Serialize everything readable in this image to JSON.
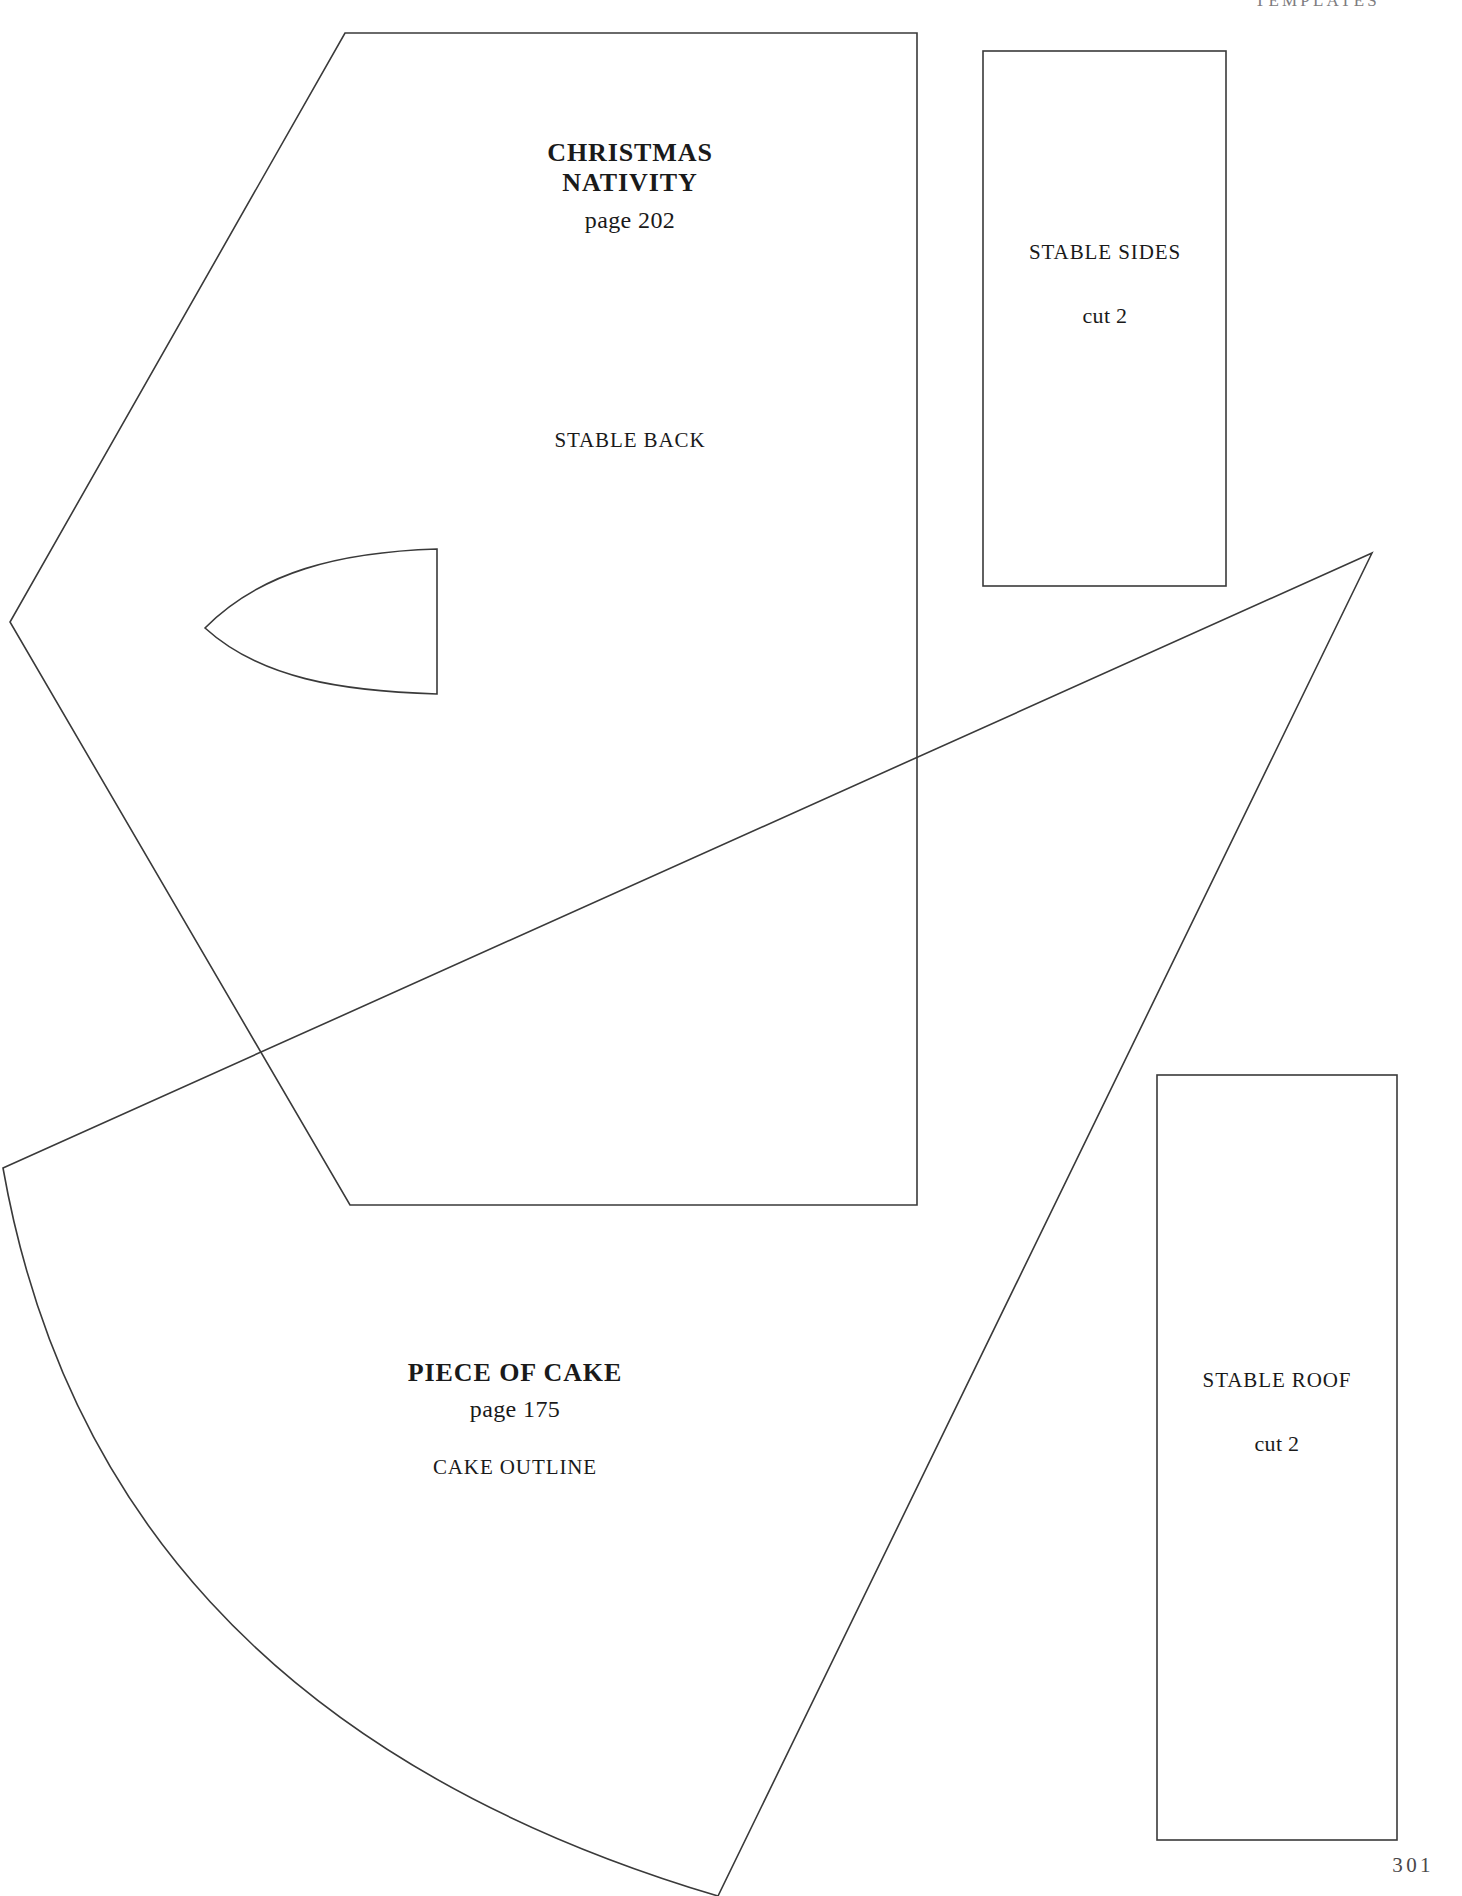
{
  "page": {
    "running_head": "TEMPLATES",
    "folio": "301",
    "background_color": "#ffffff",
    "line_color": "#3a3a3a"
  },
  "templates": [
    {
      "id": "christmas-nativity",
      "project_title": "CHRISTMAS\nNATIVITY",
      "title_line_1": "CHRISTMAS",
      "title_line_2": "NATIVITY",
      "page_ref": "page 202",
      "part_label": "STABLE BACK",
      "shape": "pentagon-gable-with-arch-cutout"
    },
    {
      "id": "stable-sides",
      "part_label": "STABLE SIDES",
      "cut_label": "cut 2",
      "shape": "rectangle"
    },
    {
      "id": "piece-of-cake",
      "title_line_1": "PIECE OF CAKE",
      "page_ref": "page 175",
      "part_label": "CAKE OUTLINE",
      "shape": "curved-wedge"
    },
    {
      "id": "stable-roof",
      "part_label": "STABLE ROOF",
      "cut_label": "cut 2",
      "shape": "rectangle"
    }
  ]
}
